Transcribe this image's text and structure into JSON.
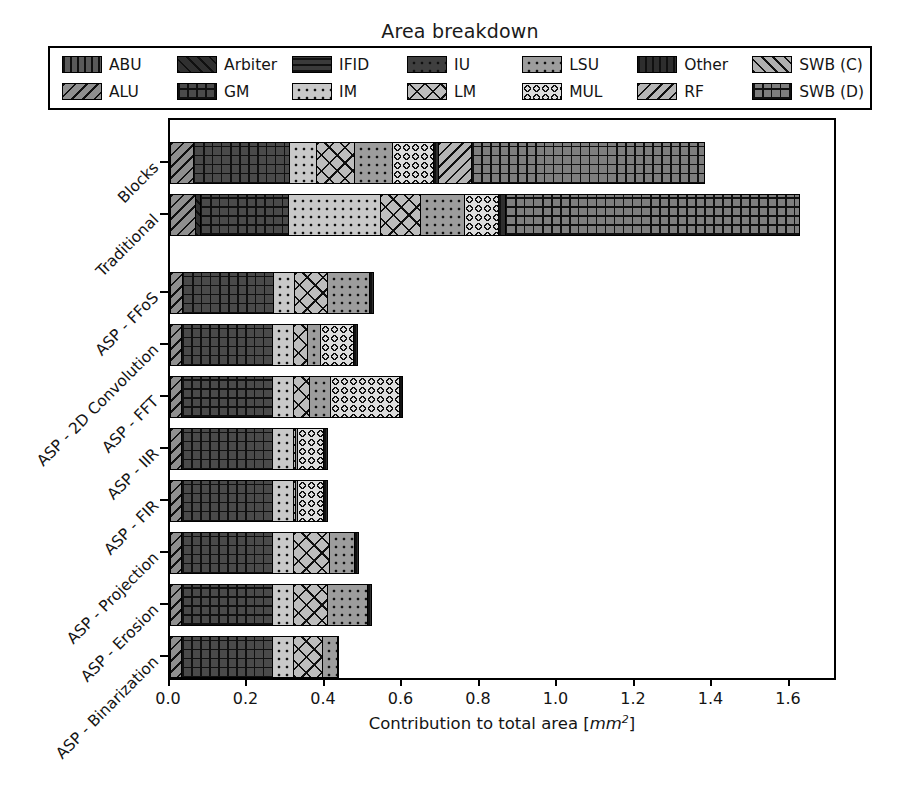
{
  "chart_data": {
    "type": "bar",
    "orientation": "horizontal",
    "stacked": true,
    "title": "Area breakdown",
    "xlabel": "Contribution to total area [mm²]",
    "ylabel": "",
    "xlim": [
      0.0,
      1.724
    ],
    "xticks": [
      0.0,
      0.2,
      0.4,
      0.6,
      0.8,
      1.0,
      1.2,
      1.4,
      1.6
    ],
    "xticklabels": [
      "0.0",
      "0.2",
      "0.4",
      "0.6",
      "0.8",
      "1.0",
      "1.2",
      "1.4",
      "1.6"
    ],
    "grid": false,
    "legend_position": "above-axes",
    "legend_columns": 8,
    "categories": [
      "Blocks",
      "Traditional",
      "ASP - FFoS",
      "ASP - 2D Convolution",
      "ASP - FFT",
      "ASP - IIR",
      "ASP - FIR",
      "ASP - Projection",
      "ASP - Erosion",
      "ASP - Binarization"
    ],
    "series": [
      {
        "name": "ABU",
        "values": [
          0.0,
          0.0,
          0.0,
          0.0,
          0.0,
          0.0,
          0.0,
          0.0,
          0.0,
          0.0
        ]
      },
      {
        "name": "ALU",
        "values": [
          0.062,
          0.067,
          0.034,
          0.033,
          0.033,
          0.033,
          0.033,
          0.033,
          0.033,
          0.033
        ]
      },
      {
        "name": "Arbiter",
        "values": [
          0.0,
          0.016,
          0.0,
          0.0,
          0.0,
          0.0,
          0.0,
          0.0,
          0.0,
          0.0
        ]
      },
      {
        "name": "GM",
        "values": [
          0.253,
          0.232,
          0.238,
          0.238,
          0.238,
          0.238,
          0.238,
          0.238,
          0.238,
          0.238
        ]
      },
      {
        "name": "IFID",
        "values": [
          0.0,
          0.0,
          0.0,
          0.0,
          0.0,
          0.0,
          0.0,
          0.0,
          0.0,
          0.0
        ]
      },
      {
        "name": "IM",
        "values": [
          0.072,
          0.24,
          0.057,
          0.057,
          0.057,
          0.057,
          0.057,
          0.057,
          0.057,
          0.057
        ]
      },
      {
        "name": "IU",
        "values": [
          0.0,
          0.0,
          0.0,
          0.0,
          0.0,
          0.0,
          0.0,
          0.0,
          0.0,
          0.0
        ]
      },
      {
        "name": "LM",
        "values": [
          0.101,
          0.108,
          0.09,
          0.039,
          0.044,
          0.008,
          0.008,
          0.096,
          0.09,
          0.077
        ]
      },
      {
        "name": "LSU",
        "values": [
          0.103,
          0.116,
          0.111,
          0.036,
          0.059,
          0.008,
          0.008,
          0.067,
          0.108,
          0.044
        ]
      },
      {
        "name": "MUL",
        "values": [
          0.108,
          0.091,
          0.0,
          0.09,
          0.18,
          0.072,
          0.072,
          0.0,
          0.0,
          0.0
        ]
      },
      {
        "name": "Other",
        "values": [
          0.016,
          0.021,
          0.013,
          0.013,
          0.01,
          0.013,
          0.013,
          0.013,
          0.013,
          0.005
        ]
      },
      {
        "name": "RF",
        "values": [
          0.09,
          0.0,
          0.0,
          0.0,
          0.0,
          0.0,
          0.0,
          0.0,
          0.0,
          0.0
        ]
      },
      {
        "name": "SWB (C)",
        "values": [
          0.0,
          0.0,
          0.0,
          0.0,
          0.0,
          0.0,
          0.0,
          0.0,
          0.0,
          0.0
        ]
      },
      {
        "name": "SWB (D)",
        "values": [
          0.603,
          0.761,
          0.0,
          0.0,
          0.0,
          0.0,
          0.0,
          0.0,
          0.0,
          0.0
        ]
      }
    ],
    "totals": [
      1.408,
      1.652,
      0.543,
      0.506,
      0.621,
      0.429,
      0.429,
      0.504,
      0.539,
      0.454
    ]
  },
  "legend": {
    "entries": [
      {
        "label": "ABU",
        "pattern": "vertical",
        "fill": "#5a5a5a"
      },
      {
        "label": "ALU",
        "pattern": "diag-back",
        "fill": "#8f8f8f"
      },
      {
        "label": "Arbiter",
        "pattern": "diag-fwd",
        "fill": "#303030"
      },
      {
        "label": "GM",
        "pattern": "cross",
        "fill": "#4a4a4a"
      },
      {
        "label": "IFID",
        "pattern": "horizontal",
        "fill": "#3a3a3a"
      },
      {
        "label": "IM",
        "pattern": "dots",
        "fill": "#c9c9c9"
      },
      {
        "label": "IU",
        "pattern": "dots",
        "fill": "#3f3f3f"
      },
      {
        "label": "LM",
        "pattern": "xcross",
        "fill": "#bdbdbd"
      },
      {
        "label": "LSU",
        "pattern": "dots",
        "fill": "#9d9d9d"
      },
      {
        "label": "MUL",
        "pattern": "circles",
        "fill": "#dcdcdc"
      },
      {
        "label": "Other",
        "pattern": "vertical",
        "fill": "#2e2e2e"
      },
      {
        "label": "RF",
        "pattern": "diag-back",
        "fill": "#b5b5b5"
      },
      {
        "label": "SWB (C)",
        "pattern": "diag-fwd",
        "fill": "#b0b0b0"
      },
      {
        "label": "SWB (D)",
        "pattern": "cross",
        "fill": "#7e7e7e"
      }
    ],
    "order": [
      "ABU",
      "Arbiter",
      "IFID",
      "IU",
      "LSU",
      "Other",
      "SWB (C)",
      "ALU",
      "GM",
      "IM",
      "LM",
      "MUL",
      "RF",
      "SWB (D)"
    ]
  },
  "colors": {
    "background": "#ffffff",
    "foreground": "#000000",
    "edge": "#000000"
  }
}
